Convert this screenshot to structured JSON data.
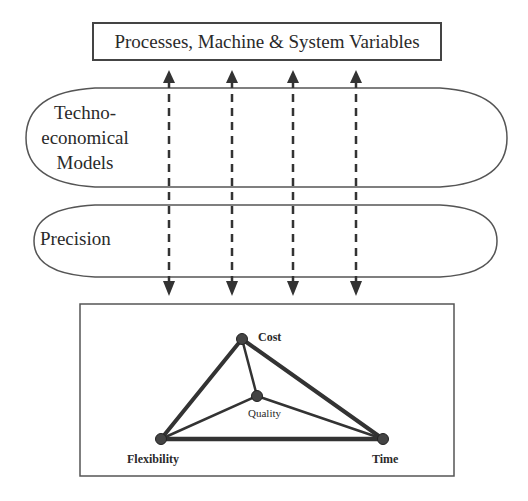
{
  "top_box": {
    "label": "Processes, Machine & System Variables"
  },
  "layers": [
    {
      "label_lines": [
        "Techno-",
        "economical",
        "Models"
      ]
    },
    {
      "label": "Precision"
    }
  ],
  "arrows": {
    "count": 4,
    "style": "dashed-bidirectional"
  },
  "triangle": {
    "nodes": {
      "cost": "Cost",
      "quality": "Quality",
      "flexibility": "Flexibility",
      "time": "Time"
    }
  }
}
